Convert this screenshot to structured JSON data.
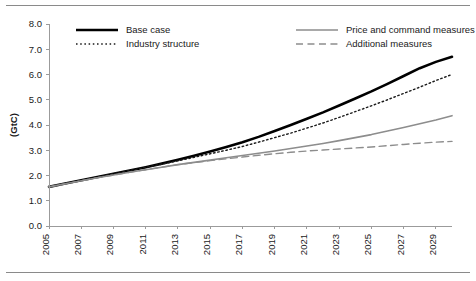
{
  "figure": {
    "axis_color": "#9b9b9b",
    "background": "#ffffff",
    "rule_color": "#8a8a8a"
  },
  "legend": {
    "items": [
      {
        "label": "Base case",
        "style": "solid",
        "color": "#000000",
        "width": 2.6
      },
      {
        "label": "Price and command measures",
        "style": "solid",
        "color": "#8d8d8d",
        "width": 1.6
      },
      {
        "label": "Industry structure",
        "style": "dotted",
        "color": "#1a1a1a",
        "width": 1.4
      },
      {
        "label": "Additional measures",
        "style": "dashed",
        "color": "#8d8d8d",
        "width": 1.4
      }
    ]
  },
  "chart_data": {
    "type": "line",
    "title": "",
    "xlabel": "",
    "ylabel": "(GtC)",
    "ylim": [
      0.0,
      8.0
    ],
    "ytick_labels": [
      "0.0",
      "1.0",
      "2.0",
      "3.0",
      "4.0",
      "5.0",
      "6.0",
      "7.0",
      "8.0"
    ],
    "ytick_values": [
      0.0,
      1.0,
      2.0,
      3.0,
      4.0,
      5.0,
      6.0,
      7.0,
      8.0
    ],
    "xlim": [
      2005,
      2030
    ],
    "xtick_labels": [
      "2005",
      "2007",
      "2009",
      "2011",
      "2013",
      "2015",
      "2017",
      "2019",
      "2021",
      "2023",
      "2025",
      "2027",
      "2029"
    ],
    "xtick_values": [
      2005,
      2007,
      2009,
      2011,
      2013,
      2015,
      2017,
      2019,
      2021,
      2023,
      2025,
      2027,
      2029
    ],
    "grid": false,
    "legend_position": "top",
    "x": [
      2005,
      2006,
      2007,
      2008,
      2009,
      2010,
      2011,
      2012,
      2013,
      2014,
      2015,
      2016,
      2017,
      2018,
      2019,
      2020,
      2021,
      2022,
      2023,
      2024,
      2025,
      2026,
      2027,
      2028,
      2029,
      2030
    ],
    "series": [
      {
        "name": "Base case",
        "style": "solid",
        "color": "#000000",
        "width": 2.6,
        "values": [
          1.55,
          1.68,
          1.81,
          1.94,
          2.07,
          2.2,
          2.33,
          2.47,
          2.62,
          2.78,
          2.95,
          3.13,
          3.32,
          3.53,
          3.76,
          4.0,
          4.25,
          4.5,
          4.77,
          5.05,
          5.33,
          5.63,
          5.94,
          6.25,
          6.5,
          6.7
        ]
      },
      {
        "name": "Industry structure",
        "style": "dotted",
        "color": "#1a1a1a",
        "width": 1.4,
        "values": [
          1.55,
          1.68,
          1.81,
          1.94,
          2.07,
          2.2,
          2.32,
          2.45,
          2.58,
          2.72,
          2.86,
          3.0,
          3.15,
          3.32,
          3.5,
          3.68,
          3.88,
          4.08,
          4.3,
          4.53,
          4.76,
          5.0,
          5.25,
          5.5,
          5.76,
          6.0
        ]
      },
      {
        "name": "Price and command measures",
        "style": "solid",
        "color": "#8d8d8d",
        "width": 1.6,
        "values": [
          1.55,
          1.67,
          1.79,
          1.91,
          2.02,
          2.13,
          2.23,
          2.33,
          2.43,
          2.52,
          2.61,
          2.7,
          2.79,
          2.88,
          2.97,
          3.07,
          3.17,
          3.27,
          3.38,
          3.5,
          3.62,
          3.76,
          3.9,
          4.05,
          4.2,
          4.37
        ]
      },
      {
        "name": "Additional measures",
        "style": "dashed",
        "color": "#8d8d8d",
        "width": 1.4,
        "values": [
          1.55,
          1.67,
          1.79,
          1.91,
          2.02,
          2.13,
          2.23,
          2.33,
          2.43,
          2.51,
          2.59,
          2.66,
          2.73,
          2.8,
          2.86,
          2.92,
          2.97,
          3.01,
          3.05,
          3.09,
          3.13,
          3.18,
          3.23,
          3.28,
          3.32,
          3.35
        ]
      }
    ]
  }
}
